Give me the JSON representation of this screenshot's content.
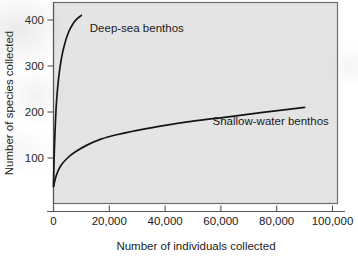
{
  "figure": {
    "background_color": "#ffffff",
    "plot_background_color": "#e4e4e4",
    "frame_color": "#6f6f6f",
    "curve_color": "#151515"
  },
  "chart_data": {
    "type": "line",
    "title": "",
    "subtitle": "",
    "xlabel": "Number of individuals collected",
    "ylabel": "Number of species collected",
    "xlim": [
      0,
      100000
    ],
    "ylim": [
      0,
      440
    ],
    "xticks": [
      0,
      20000,
      40000,
      60000,
      80000,
      100000
    ],
    "xticklabels": [
      "0",
      "20,000",
      "40,000",
      "60,000",
      "80,000",
      "100,000"
    ],
    "yticks": [
      100,
      200,
      300,
      400
    ],
    "yticklabels": [
      "100",
      "200",
      "300",
      "400"
    ],
    "grid": false,
    "legend": "none",
    "annotations": [
      {
        "text": "Deep-sea benthos",
        "x": 13000,
        "y": 375
      },
      {
        "text": "Shallow-water benthos",
        "x": 57000,
        "y": 172
      }
    ],
    "series": [
      {
        "name": "Deep-sea benthos",
        "x": [
          0,
          200,
          500,
          1000,
          1800,
          2800,
          4000,
          5500,
          7000,
          8500,
          10000
        ],
        "values": [
          38,
          95,
          150,
          215,
          272,
          315,
          348,
          375,
          392,
          403,
          410
        ]
      },
      {
        "name": "Shallow-water benthos",
        "x": [
          0,
          1000,
          2500,
          5000,
          8000,
          12000,
          17000,
          23000,
          30000,
          40000,
          50000,
          62000,
          75000,
          90000
        ],
        "values": [
          38,
          62,
          82,
          100,
          114,
          128,
          141,
          151,
          160,
          171,
          180,
          189,
          199,
          210
        ]
      }
    ]
  }
}
